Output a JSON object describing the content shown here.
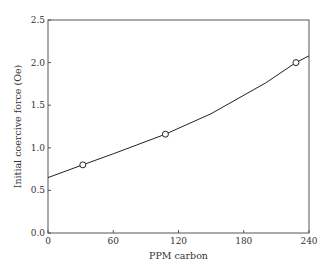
{
  "chart_data": {
    "type": "line",
    "title": "",
    "xlabel": "PPM carbon",
    "ylabel": "Initial coercive force (Oe)",
    "xlim": [
      0,
      240
    ],
    "ylim": [
      0.0,
      2.5
    ],
    "xticks": [
      "0",
      "60",
      "120",
      "180",
      "240"
    ],
    "yticks": [
      "0.0",
      "0.5",
      "1.0",
      "1.5",
      "2.0",
      "2.5"
    ],
    "grid": false,
    "legend": null,
    "series": [
      {
        "name": "fitted curve",
        "x": [
          0,
          32,
          60,
          108,
          150,
          200,
          228,
          240
        ],
        "y": [
          0.65,
          0.8,
          0.93,
          1.16,
          1.4,
          1.76,
          2.0,
          2.08
        ]
      },
      {
        "name": "measured points",
        "marker": "open-circle",
        "x": [
          32,
          108,
          228
        ],
        "y": [
          0.8,
          1.16,
          2.0
        ]
      }
    ]
  }
}
